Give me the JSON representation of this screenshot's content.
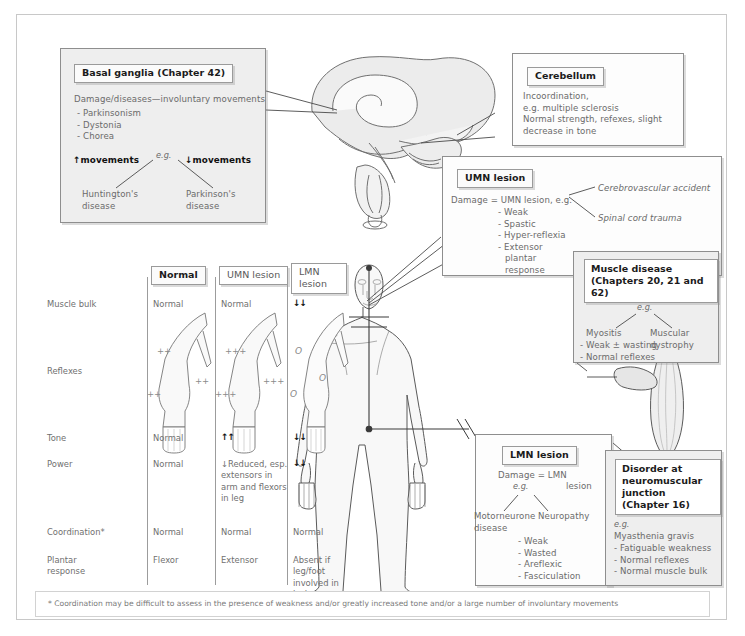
{
  "page": {
    "footnote": "* Coordination may be difficult to assess in the presence of weakness and/or greatly increased tone and/or a large number of involuntary movements"
  },
  "basal_ganglia": {
    "title": "Basal ganglia (Chapter 42)",
    "lead": "Damage/diseases—involuntary movements",
    "items": [
      "- Parkinsonism",
      "- Dystonia",
      "- Chorea"
    ],
    "eg": "e.g.",
    "left_branch_label": "↑movements",
    "right_branch_label": "↓movements",
    "left_outcome_1": "Huntington's",
    "left_outcome_2": "disease",
    "right_outcome_1": "Parkinson's",
    "right_outcome_2": "disease"
  },
  "cerebellum": {
    "title": "Cerebellum",
    "lines": [
      "Incoordination,",
      "e.g. multiple sclerosis",
      "Normal strength, refexes, slight",
      "decrease in tone"
    ]
  },
  "umn": {
    "title": "UMN lesion",
    "lead": "Damage = UMN lesion, e.g.",
    "items": [
      "- Weak",
      "- Spastic",
      "- Hyper-reflexia",
      "- Extensor",
      "plantar",
      "response"
    ],
    "cause_1": "Cerebrovascular accident",
    "cause_2": "Spinal cord trauma"
  },
  "muscle_disease": {
    "title_1": "Muscle disease",
    "title_2": "(Chapters 20, 21 and 62)",
    "eg": "e.g.",
    "left_1": "Myositis",
    "right_1": "Muscular",
    "right_2": "dystrophy",
    "items": [
      "- Weak ± wasting",
      "- Normal reflexes"
    ]
  },
  "lmn": {
    "title": "LMN lesion",
    "lead_1": "Damage = LMN",
    "lead_2": "lesion",
    "eg": "e.g.",
    "left_1": "Motorneurone",
    "left_2": "disease",
    "right_1": "Neuropathy",
    "items": [
      "- Weak",
      "- Wasted",
      "- Areflexic",
      "- Fasciculation"
    ]
  },
  "nmj": {
    "title_1": "Disorder at",
    "title_2": "neuromuscular",
    "title_3": "junction (Chapter 16)",
    "eg": "e.g.",
    "lead": "Myasthenia gravis",
    "items": [
      "- Fatiguable weakness",
      "- Normal reflexes",
      "- Normal muscle bulk"
    ]
  },
  "table": {
    "columns": [
      "Normal",
      "UMN lesion",
      "LMN lesion"
    ],
    "rows": [
      "Muscle bulk",
      "Reflexes",
      "Tone",
      "Power",
      "Coordination*",
      "Plantar",
      "response"
    ],
    "muscle_bulk": {
      "normal": "Normal",
      "umn": "Normal",
      "lmn": "↓↓"
    },
    "reflexes": {
      "normal": [
        "++",
        "++",
        "++"
      ],
      "umn": [
        "+++",
        "+++",
        "+++"
      ],
      "lmn": [
        "O",
        "O",
        "O"
      ]
    },
    "tone": {
      "normal": "Normal",
      "umn": "↑↑",
      "lmn": "↓↓"
    },
    "power": {
      "normal": "Normal",
      "umn": [
        "↓Reduced, esp.",
        "extensors in",
        "arm and flexors",
        "in leg"
      ],
      "lmn": "↓↓"
    },
    "coordination": {
      "normal": "Normal",
      "umn": "Normal",
      "lmn": "Normal"
    },
    "plantar": {
      "normal": "Flexor",
      "umn": "Extensor",
      "lmn": [
        "Absent if leg/foot",
        "involved in lesion"
      ]
    }
  }
}
